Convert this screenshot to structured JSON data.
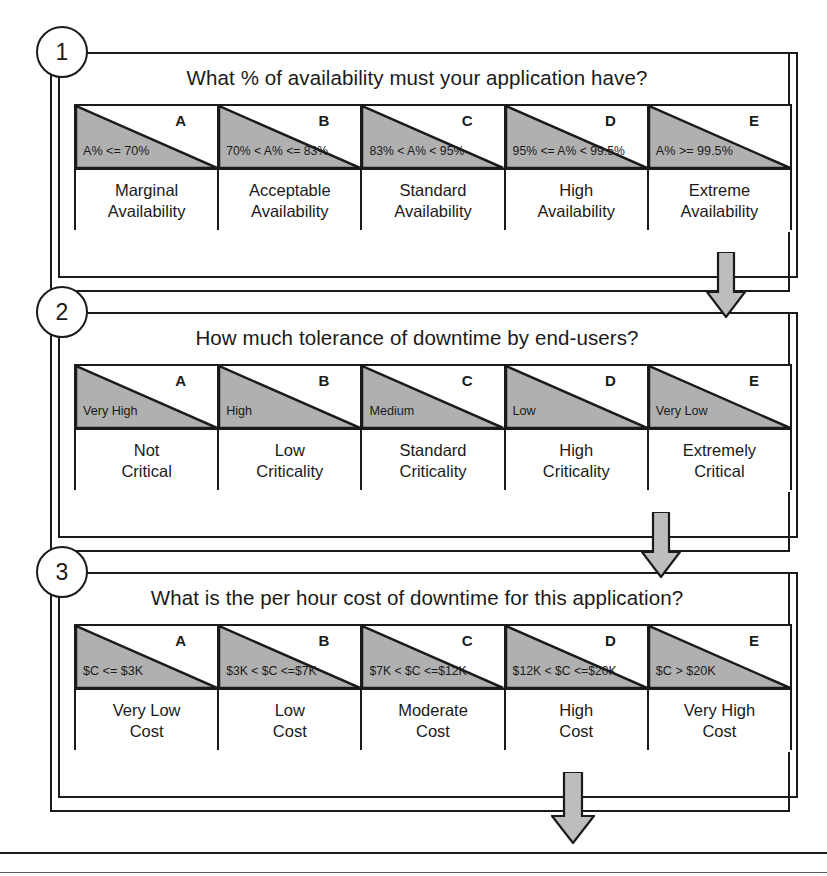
{
  "diagram": {
    "shading_color": "#b0b0b0",
    "line_color": "#1a1a1a",
    "arrow_fill": "#bdbdbd"
  },
  "steps": [
    {
      "number": "1",
      "question": "What % of availability must your application have?",
      "columns": [
        {
          "letter": "A",
          "range": "A% <= 70%",
          "label_line1": "Marginal",
          "label_line2": "Availability"
        },
        {
          "letter": "B",
          "range": "70% < A% <= 83%",
          "label_line1": "Acceptable",
          "label_line2": "Availability"
        },
        {
          "letter": "C",
          "range": "83% < A% < 95%",
          "label_line1": "Standard",
          "label_line2": "Availability"
        },
        {
          "letter": "D",
          "range": "95% <= A% < 99.5%",
          "label_line1": "High",
          "label_line2": "Availability"
        },
        {
          "letter": "E",
          "range": "A% >= 99.5%",
          "label_line1": "Extreme",
          "label_line2": "Availability"
        }
      ]
    },
    {
      "number": "2",
      "question": "How much tolerance of downtime by end-users?",
      "columns": [
        {
          "letter": "A",
          "range": "Very High",
          "label_line1": "Not",
          "label_line2": "Critical"
        },
        {
          "letter": "B",
          "range": "High",
          "label_line1": "Low",
          "label_line2": "Criticality"
        },
        {
          "letter": "C",
          "range": "Medium",
          "label_line1": "Standard",
          "label_line2": "Criticality"
        },
        {
          "letter": "D",
          "range": "Low",
          "label_line1": "High",
          "label_line2": "Criticality"
        },
        {
          "letter": "E",
          "range": "Very Low",
          "label_line1": "Extremely",
          "label_line2": "Critical"
        }
      ]
    },
    {
      "number": "3",
      "question": "What is the per hour cost of downtime for this application?",
      "columns": [
        {
          "letter": "A",
          "range": "$C <= $3K",
          "label_line1": "Very Low",
          "label_line2": "Cost"
        },
        {
          "letter": "B",
          "range": "$3K < $C <=$7K",
          "label_line1": "Low",
          "label_line2": "Cost"
        },
        {
          "letter": "C",
          "range": "$7K < $C <=$12K",
          "label_line1": "Moderate",
          "label_line2": "Cost"
        },
        {
          "letter": "D",
          "range": "$12K < $C <=$20K",
          "label_line1": "High",
          "label_line2": "Cost"
        },
        {
          "letter": "E",
          "range": "$C > $20K",
          "label_line1": "Very High",
          "label_line2": "Cost"
        }
      ]
    }
  ],
  "connectors": [
    {
      "name": "arrow-step1-to-step2",
      "direction": "down"
    },
    {
      "name": "arrow-step2-to-step3",
      "direction": "down"
    },
    {
      "name": "arrow-step3-to-output",
      "direction": "down"
    }
  ]
}
